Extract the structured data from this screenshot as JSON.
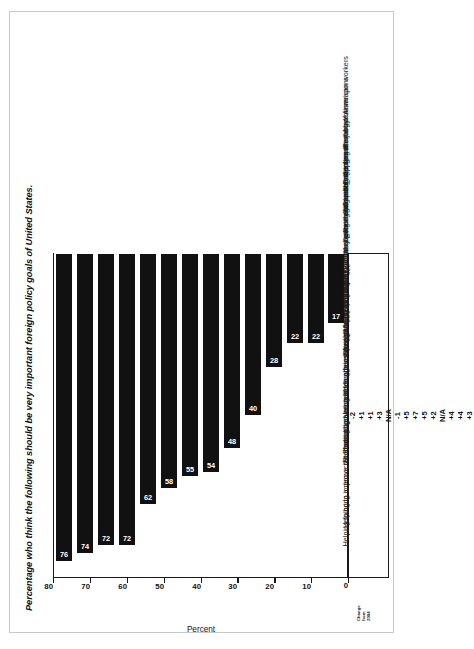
{
  "chart_data": {
    "type": "bar",
    "orientation": "vertical",
    "title": "Percentage who think the following should be very important foreign policy goals of United States.",
    "xlabel": "",
    "ylabel": "Percent",
    "ylim": [
      0,
      80
    ],
    "yticks": [
      0,
      10,
      20,
      30,
      40,
      50,
      60,
      70,
      80
    ],
    "grid": false,
    "legend": null,
    "bar_color": "#111111",
    "value_label_color": "#ffffff",
    "change_column_header": [
      "Change",
      "from",
      "2004"
    ],
    "categories": [
      "Protecting the jobs of American workers",
      "Preventing the spread of nuclear weapons",
      "Combating international terrorism",
      "Securing adequate supplies of energy",
      "Promoting economic growth",
      "Controlling and reducing illegal immigration",
      "Maintaining superior military power worldwide",
      "Improving the global environment",
      "Combating world hunger",
      "Strengthening the United Nations",
      "Promoting and defending human rights in other countries",
      "Protecting weaker nations against foreign aggression",
      "Helping to improve the standard of living of less-developed nations",
      "Helping to bring a democratic form of government to other nations"
    ],
    "values": [
      76,
      74,
      72,
      72,
      62,
      58,
      55,
      54,
      48,
      40,
      28,
      22,
      22,
      17
    ],
    "changes": [
      "-2",
      "+1",
      "+1",
      "+3",
      "N/A",
      "-1",
      "+5",
      "+7",
      "+5",
      "+2",
      "N/A",
      "+4",
      "+4",
      "+3"
    ]
  }
}
